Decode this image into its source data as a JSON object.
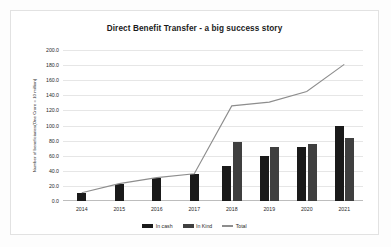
{
  "chart_data": {
    "type": "bar",
    "title": "Direct Benefit Transfer - a big success story",
    "xlabel": "",
    "ylabel": "Number of beneficiaries(One Crore = 10 million)",
    "categories": [
      "2014",
      "2015",
      "2016",
      "2017",
      "2018",
      "2019",
      "2020",
      "2021"
    ],
    "ylim": [
      0,
      200
    ],
    "ytick_step": 20,
    "ytick_labels": [
      "0.0",
      "20.0",
      "40.0",
      "60.0",
      "80.0",
      "100.0",
      "120.0",
      "140.0",
      "160.0",
      "180.0",
      "200.0"
    ],
    "grid": true,
    "legend_position": "bottom",
    "series": [
      {
        "name": "In cash",
        "type": "bar",
        "color": "#1a1a1a",
        "values": [
          11,
          23,
          30,
          36,
          47,
          60,
          72,
          99
        ]
      },
      {
        "name": "In Kind",
        "type": "bar",
        "color": "#3f3f3f",
        "values": [
          null,
          null,
          null,
          null,
          78,
          71,
          76,
          83
        ]
      },
      {
        "name": "Total",
        "type": "line",
        "color": "#8d8d8d",
        "values": [
          11,
          23,
          31,
          36,
          126,
          131,
          145,
          181
        ]
      }
    ]
  },
  "legend": {
    "items": [
      {
        "label": "In cash"
      },
      {
        "label": "In Kind"
      },
      {
        "label": "Total"
      }
    ]
  }
}
